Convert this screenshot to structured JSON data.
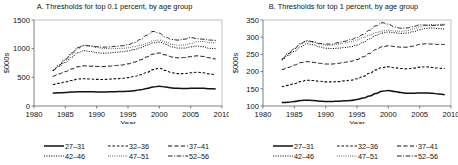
{
  "figure": {
    "panels": [
      {
        "id": "panel-a",
        "title": "A. Thresholds for top 0.1 percent, by age group",
        "ylabel": "$000s",
        "xlabel": "Year"
      },
      {
        "id": "panel-b",
        "title": "B. Thresholds for top 1 percent, by age group",
        "ylabel": "$000s",
        "xlabel": "Year"
      }
    ],
    "legend": {
      "entries": [
        {
          "label": "27–31",
          "style": "solid"
        },
        {
          "label": "32–36",
          "style": "short-dash"
        },
        {
          "label": "37–41",
          "style": "long-dash"
        },
        {
          "label": "42–46",
          "style": "dotted"
        },
        {
          "label": "47–51",
          "style": "fine-dotted"
        },
        {
          "label": "52–56",
          "style": "dash-dot"
        }
      ]
    }
  },
  "chart_data": [
    {
      "type": "line",
      "title": "A. Thresholds for top 0.1 percent, by age group",
      "xlabel": "Year",
      "ylabel": "$000s",
      "xlim": [
        1980,
        2010
      ],
      "ylim": [
        0,
        1500
      ],
      "xticks": [
        1980,
        1985,
        1990,
        1995,
        2000,
        2005,
        2010
      ],
      "yticks": [
        0,
        500,
        1000,
        1500
      ],
      "grid": false,
      "legend_position": "below",
      "x": [
        1983,
        1984,
        1985,
        1986,
        1987,
        1988,
        1989,
        1990,
        1991,
        1992,
        1993,
        1994,
        1995,
        1996,
        1997,
        1998,
        1999,
        2000,
        2001,
        2002,
        2003,
        2004,
        2005,
        2006,
        2007,
        2008,
        2009
      ],
      "series": [
        {
          "name": "27–31",
          "style": "solid",
          "values": [
            225,
            230,
            235,
            243,
            248,
            250,
            248,
            245,
            244,
            248,
            250,
            252,
            258,
            268,
            285,
            305,
            330,
            345,
            330,
            315,
            308,
            305,
            308,
            310,
            308,
            300,
            298
          ]
        },
        {
          "name": "32–36",
          "style": "short-dash",
          "values": [
            375,
            395,
            420,
            445,
            470,
            475,
            470,
            465,
            462,
            468,
            475,
            480,
            495,
            515,
            545,
            585,
            635,
            660,
            620,
            580,
            565,
            565,
            580,
            590,
            580,
            560,
            545
          ]
        },
        {
          "name": "37–41",
          "style": "long-dash",
          "values": [
            520,
            560,
            600,
            645,
            685,
            700,
            695,
            690,
            688,
            695,
            705,
            715,
            735,
            765,
            805,
            855,
            905,
            925,
            890,
            855,
            840,
            845,
            860,
            875,
            865,
            840,
            820
          ]
        },
        {
          "name": "42–46",
          "style": "dotted",
          "values": [
            620,
            690,
            760,
            850,
            930,
            965,
            950,
            930,
            920,
            925,
            935,
            945,
            960,
            985,
            1015,
            1060,
            1100,
            1115,
            1075,
            1030,
            1010,
            1010,
            1030,
            1045,
            1035,
            1005,
            1000
          ]
        },
        {
          "name": "47–51",
          "style": "fine-dotted",
          "values": [
            625,
            710,
            800,
            900,
            1000,
            1050,
            1040,
            1020,
            1005,
            1000,
            1000,
            1005,
            1015,
            1035,
            1060,
            1095,
            1135,
            1150,
            1115,
            1075,
            1060,
            1065,
            1090,
            1120,
            1125,
            1105,
            1100
          ]
        },
        {
          "name": "52–56",
          "style": "dash-dot",
          "values": [
            620,
            715,
            815,
            925,
            1020,
            1060,
            1050,
            1035,
            1025,
            1030,
            1040,
            1050,
            1070,
            1105,
            1160,
            1235,
            1300,
            1270,
            1200,
            1160,
            1150,
            1165,
            1195,
            1175,
            1165,
            1150,
            1145
          ]
        }
      ]
    },
    {
      "type": "line",
      "title": "B. Thresholds for top 1 percent, by age group",
      "xlabel": "Year",
      "ylabel": "$000s",
      "xlim": [
        1980,
        2010
      ],
      "ylim": [
        100,
        350
      ],
      "xticks": [
        1980,
        1985,
        1990,
        1995,
        2000,
        2005,
        2010
      ],
      "yticks": [
        100,
        150,
        200,
        250,
        300,
        350
      ],
      "grid": false,
      "legend_position": "below",
      "x": [
        1983,
        1984,
        1985,
        1986,
        1987,
        1988,
        1989,
        1990,
        1991,
        1992,
        1993,
        1994,
        1995,
        1996,
        1997,
        1998,
        1999,
        2000,
        2001,
        2002,
        2003,
        2004,
        2005,
        2006,
        2007,
        2008,
        2009
      ],
      "series": [
        {
          "name": "27–31",
          "style": "solid",
          "values": [
            110,
            111,
            113,
            116,
            117,
            116,
            114,
            113,
            113,
            114,
            115,
            116,
            119,
            123,
            129,
            136,
            143,
            145,
            142,
            139,
            137,
            137,
            138,
            138,
            137,
            135,
            133
          ]
        },
        {
          "name": "32–36",
          "style": "short-dash",
          "values": [
            156,
            160,
            165,
            171,
            175,
            174,
            172,
            170,
            170,
            171,
            173,
            175,
            179,
            186,
            195,
            205,
            212,
            214,
            211,
            209,
            208,
            210,
            213,
            214,
            212,
            210,
            209
          ]
        },
        {
          "name": "37–41",
          "style": "long-dash",
          "values": [
            206,
            212,
            219,
            226,
            229,
            227,
            224,
            222,
            222,
            224,
            227,
            230,
            235,
            243,
            253,
            264,
            272,
            275,
            273,
            271,
            271,
            274,
            279,
            281,
            280,
            279,
            279
          ]
        },
        {
          "name": "42–46",
          "style": "dotted",
          "values": [
            234,
            247,
            259,
            272,
            281,
            278,
            272,
            268,
            267,
            268,
            270,
            272,
            277,
            285,
            295,
            305,
            312,
            315,
            313,
            311,
            312,
            316,
            322,
            326,
            327,
            325,
            324
          ]
        },
        {
          "name": "47–51",
          "style": "fine-dotted",
          "values": [
            237,
            252,
            266,
            280,
            288,
            285,
            280,
            277,
            277,
            280,
            283,
            287,
            292,
            299,
            306,
            313,
            318,
            320,
            318,
            317,
            319,
            324,
            330,
            335,
            337,
            337,
            338
          ]
        },
        {
          "name": "52–56",
          "style": "dash-dot",
          "values": [
            236,
            252,
            267,
            282,
            290,
            287,
            282,
            280,
            280,
            284,
            288,
            293,
            299,
            308,
            320,
            333,
            342,
            338,
            330,
            326,
            327,
            331,
            336,
            335,
            334,
            334,
            336
          ]
        }
      ]
    }
  ]
}
